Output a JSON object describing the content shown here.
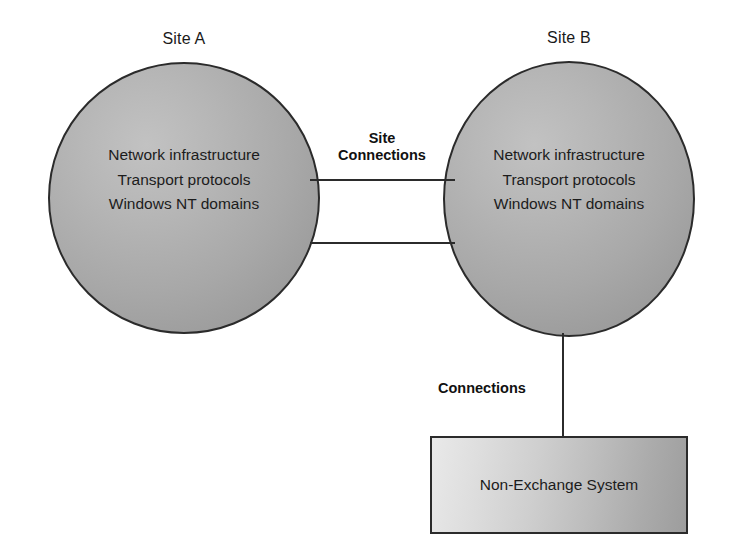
{
  "diagram": {
    "background_color": "#ffffff",
    "stroke_color": "#2b2b2b",
    "nodes": {
      "site_a": {
        "title": "Site A",
        "shape": "circle",
        "fill": "#a8a8a8",
        "lines": [
          "Network infrastructure",
          "Transport protocols",
          "Windows NT domains"
        ]
      },
      "site_b": {
        "title": "Site B",
        "shape": "circle",
        "fill": "#a8a8a8",
        "lines": [
          "Network infrastructure",
          "Transport protocols",
          "Windows NT domains"
        ]
      },
      "non_exchange_system": {
        "title": "Non-Exchange System",
        "shape": "rectangle",
        "fill_from": "#e9e9e9",
        "fill_to": "#9d9d9d"
      }
    },
    "connectors": {
      "site_connections": {
        "label_line_1": "Site",
        "label_line_2": "Connections",
        "from": "Site A",
        "to": "Site B",
        "line_count": 2,
        "orientation": "horizontal"
      },
      "system_connections": {
        "label": "Connections",
        "from": "Site B",
        "to": "Non-Exchange System",
        "line_count": 1,
        "orientation": "vertical"
      }
    }
  }
}
